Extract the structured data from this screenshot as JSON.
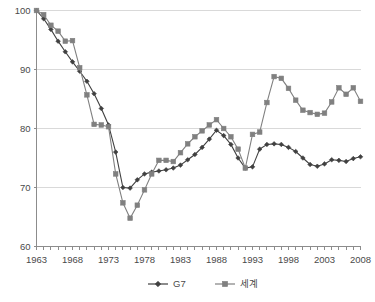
{
  "chart_data": {
    "type": "line",
    "title": "",
    "subtitle": "",
    "xlabel": "",
    "ylabel": "",
    "xlim": [
      1963,
      2008
    ],
    "ylim": [
      60,
      100
    ],
    "yticks": [
      60,
      70,
      80,
      90,
      100
    ],
    "xticks": [
      1963,
      1968,
      1973,
      1978,
      1983,
      1988,
      1993,
      1998,
      2003,
      2008
    ],
    "grid": true,
    "legend_position": "bottom",
    "x": [
      1963,
      1964,
      1965,
      1966,
      1967,
      1968,
      1969,
      1970,
      1971,
      1972,
      1973,
      1974,
      1975,
      1976,
      1977,
      1978,
      1979,
      1980,
      1981,
      1982,
      1983,
      1984,
      1985,
      1986,
      1987,
      1988,
      1989,
      1990,
      1991,
      1992,
      1993,
      1994,
      1995,
      1996,
      1997,
      1998,
      1999,
      2000,
      2001,
      2002,
      2003,
      2004,
      2005,
      2006,
      2007,
      2008
    ],
    "series": [
      {
        "name": "G7",
        "color": "#404040",
        "marker": "diamond",
        "values": [
          100.0,
          98.6,
          96.8,
          94.8,
          93.0,
          91.3,
          89.7,
          88.0,
          85.9,
          83.4,
          80.6,
          76.0,
          70.0,
          69.9,
          71.3,
          72.3,
          72.6,
          72.8,
          73.0,
          73.3,
          73.8,
          74.7,
          75.6,
          76.8,
          78.2,
          79.7,
          78.8,
          77.3,
          75.0,
          73.3,
          73.5,
          76.5,
          77.3,
          77.4,
          77.3,
          76.8,
          76.1,
          75.0,
          73.9,
          73.6,
          74.0,
          74.7,
          74.6,
          74.4,
          74.9,
          75.2
        ]
      },
      {
        "name": "세계",
        "color": "#808080",
        "marker": "square",
        "values": [
          100.0,
          99.3,
          97.5,
          96.5,
          94.8,
          94.9,
          90.3,
          85.7,
          80.7,
          80.6,
          80.3,
          72.3,
          67.4,
          64.8,
          67.0,
          69.6,
          72.3,
          74.6,
          74.6,
          74.4,
          75.9,
          77.4,
          78.6,
          79.6,
          80.6,
          81.5,
          80.0,
          78.6,
          76.5,
          73.3,
          79.0,
          79.4,
          84.4,
          88.8,
          88.5,
          86.8,
          84.8,
          83.1,
          82.7,
          82.4,
          82.6,
          84.5,
          86.9,
          85.8,
          86.9,
          84.6
        ]
      }
    ]
  },
  "legend": {
    "items": [
      {
        "label": "G7",
        "color": "#404040",
        "marker": "diamond"
      },
      {
        "label": "세계",
        "color": "#808080",
        "marker": "square"
      }
    ]
  }
}
